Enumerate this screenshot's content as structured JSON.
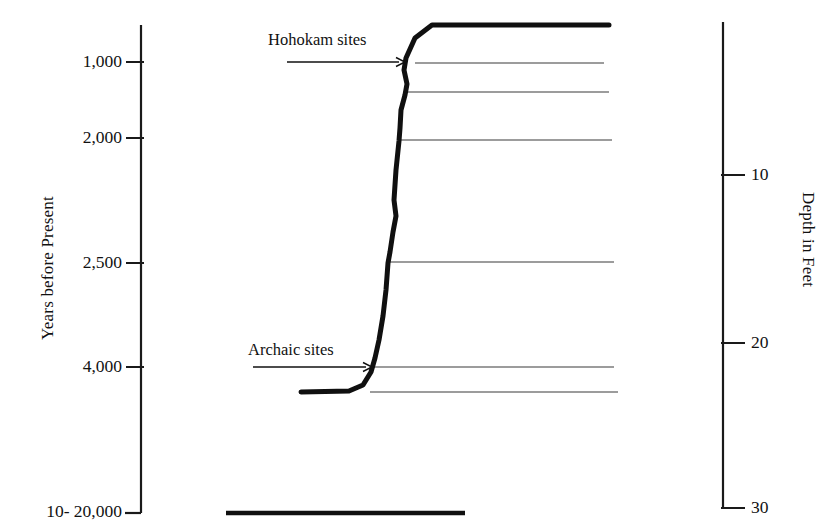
{
  "chart_data": {
    "type": "line",
    "title": "",
    "subtitle": "",
    "ylabel_left": "Years before Present",
    "ylabel_right": "Depth in Feet",
    "xlabel": "",
    "grid": false,
    "legend": "none",
    "left_axis": {
      "label": "Years before Present",
      "ticks": [
        {
          "label": "1,000",
          "value": 1000,
          "y": 62
        },
        {
          "label": "2,000",
          "value": 2000,
          "y": 138
        },
        {
          "label": "2,500",
          "value": 2500,
          "y": 263
        },
        {
          "label": "4,000",
          "value": 4000,
          "y": 367
        },
        {
          "label": "10- 20,000",
          "value": 20000,
          "y": 512
        }
      ],
      "axis_top_y": 25,
      "axis_bottom_y": 513,
      "axis_x": 141
    },
    "right_axis": {
      "label": "Depth in Feet",
      "ticks": [
        {
          "label": "10",
          "value": 10,
          "y": 175
        },
        {
          "label": "20",
          "value": 20,
          "y": 343
        },
        {
          "label": "30",
          "value": 30,
          "y": 508
        }
      ],
      "axis_top_y": 22,
      "axis_bottom_y": 509,
      "axis_x": 723
    },
    "annotations": [
      {
        "text": "Hohokam sites",
        "x": 268,
        "y": 42,
        "arrow_from_x": 287,
        "arrow_to_x": 405,
        "arrow_y": 62
      },
      {
        "text": "Archaic sites",
        "x": 248,
        "y": 352,
        "arrow_from_x": 253,
        "arrow_to_x": 372,
        "arrow_y": 367
      }
    ],
    "horizon_lines": [
      {
        "depth_feet_approx": 3.4,
        "y": 63,
        "x_start": 415,
        "x_end": 604
      },
      {
        "depth_feet_approx": 5.1,
        "y": 92,
        "x_start": 407,
        "x_end": 609
      },
      {
        "depth_feet_approx": 8.0,
        "y": 140,
        "x_start": 398,
        "x_end": 612
      },
      {
        "depth_feet_approx": 15.2,
        "y": 262,
        "x_start": 388,
        "x_end": 614
      },
      {
        "depth_feet_approx": 21.4,
        "y": 367,
        "x_start": 374,
        "x_end": 614
      },
      {
        "depth_feet_approx": 23.0,
        "y": 392,
        "x_start": 370,
        "x_end": 618
      }
    ],
    "curve_points": [
      {
        "x": 609,
        "y": 25
      },
      {
        "x": 432,
        "y": 25
      },
      {
        "x": 415,
        "y": 38
      },
      {
        "x": 406,
        "y": 58
      },
      {
        "x": 404,
        "y": 70
      },
      {
        "x": 407,
        "y": 84
      },
      {
        "x": 405,
        "y": 95
      },
      {
        "x": 401,
        "y": 110
      },
      {
        "x": 400,
        "y": 128
      },
      {
        "x": 399,
        "y": 141
      },
      {
        "x": 396,
        "y": 170
      },
      {
        "x": 394,
        "y": 200
      },
      {
        "x": 396,
        "y": 216
      },
      {
        "x": 393,
        "y": 232
      },
      {
        "x": 390,
        "y": 252
      },
      {
        "x": 388,
        "y": 263
      },
      {
        "x": 386,
        "y": 290
      },
      {
        "x": 383,
        "y": 316
      },
      {
        "x": 379,
        "y": 340
      },
      {
        "x": 375,
        "y": 358
      },
      {
        "x": 371,
        "y": 372
      },
      {
        "x": 363,
        "y": 385
      },
      {
        "x": 349,
        "y": 391
      },
      {
        "x": 301,
        "y": 392
      }
    ],
    "bottom_bar": {
      "y": 513,
      "x_start": 226,
      "x_end": 465
    },
    "styling": {
      "curve_color": "#101010",
      "curve_width": 5,
      "horizon_line_color": "#3a3a3a",
      "horizon_line_width": 1.2,
      "axis_color": "#1a1a1a",
      "axis_width": 2.2,
      "background": "#ffffff"
    }
  }
}
